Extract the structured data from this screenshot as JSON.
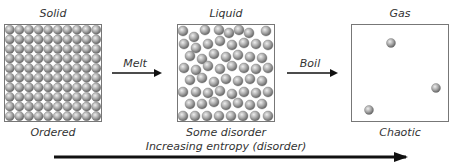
{
  "states": [
    {
      "title": "Solid",
      "caption": "Ordered"
    },
    {
      "title": "Liquid",
      "caption": "Some disorder"
    },
    {
      "title": "Gas",
      "caption": "Chaotic"
    }
  ],
  "transitions": [
    {
      "label": "Melt"
    },
    {
      "label": "Boil"
    }
  ],
  "axis": {
    "label": "Increasing entropy (disorder)"
  },
  "colors": {
    "particle_light": "#e6e6e6",
    "particle_mid": "#a8a8a8",
    "particle_dark": "#6a6a6a",
    "box_border": "#777777",
    "arrow": "#111111"
  },
  "solid_grid": {
    "rows": 10,
    "cols": 10
  },
  "liquid_particles": [
    [
      183,
      31
    ],
    [
      194,
      37
    ],
    [
      205,
      30
    ],
    [
      219,
      30
    ],
    [
      229,
      33
    ],
    [
      239,
      30
    ],
    [
      249,
      33
    ],
    [
      266,
      31
    ],
    [
      184,
      44
    ],
    [
      196,
      48
    ],
    [
      208,
      44
    ],
    [
      220,
      41
    ],
    [
      232,
      45
    ],
    [
      244,
      43
    ],
    [
      256,
      44
    ],
    [
      268,
      45
    ],
    [
      190,
      56
    ],
    [
      202,
      59
    ],
    [
      214,
      54
    ],
    [
      226,
      57
    ],
    [
      238,
      55
    ],
    [
      250,
      57
    ],
    [
      262,
      58
    ],
    [
      184,
      68
    ],
    [
      196,
      70
    ],
    [
      208,
      66
    ],
    [
      220,
      69
    ],
    [
      232,
      66
    ],
    [
      244,
      68
    ],
    [
      256,
      69
    ],
    [
      268,
      68
    ],
    [
      190,
      80
    ],
    [
      202,
      78
    ],
    [
      214,
      82
    ],
    [
      226,
      79
    ],
    [
      238,
      81
    ],
    [
      250,
      79
    ],
    [
      262,
      81
    ],
    [
      183,
      92
    ],
    [
      196,
      92
    ],
    [
      208,
      93
    ],
    [
      220,
      91
    ],
    [
      232,
      94
    ],
    [
      244,
      92
    ],
    [
      256,
      93
    ],
    [
      268,
      92
    ],
    [
      190,
      104
    ],
    [
      202,
      104
    ],
    [
      214,
      102
    ],
    [
      226,
      105
    ],
    [
      238,
      103
    ],
    [
      250,
      105
    ],
    [
      262,
      104
    ],
    [
      183,
      116
    ],
    [
      195,
      116
    ],
    [
      207,
      116
    ],
    [
      219,
      116
    ],
    [
      231,
      116
    ],
    [
      243,
      116
    ],
    [
      255,
      116
    ],
    [
      268,
      116
    ]
  ],
  "gas_particles": [
    [
      391,
      43
    ],
    [
      436,
      88
    ],
    [
      369,
      110
    ]
  ]
}
